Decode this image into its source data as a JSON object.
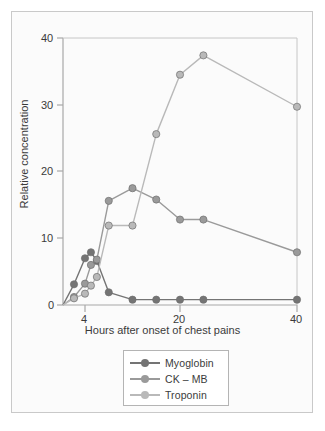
{
  "chart_data": {
    "type": "line",
    "title": "",
    "xlabel": "Hours after onset of chest pains",
    "ylabel": "Relative concentration",
    "xticks": [
      4,
      20,
      40
    ],
    "xtick_labels": [
      "4",
      "20",
      "40"
    ],
    "yticks": [
      0,
      10,
      20,
      30,
      40
    ],
    "ytick_labels": [
      "0",
      "10",
      "20",
      "30",
      "40"
    ],
    "ylim": [
      0,
      40
    ],
    "xlim": [
      2,
      40
    ],
    "grid": false,
    "legend_position": "bottom-center",
    "series": [
      {
        "name": "Myoglobin",
        "color": "#747474",
        "x": [
          2,
          3,
          4,
          5,
          6,
          8,
          12,
          16,
          20,
          24,
          40
        ],
        "y": [
          0,
          3.1,
          7.0,
          7.9,
          6.6,
          1.9,
          0.8,
          0.8,
          0.8,
          0.8,
          0.8
        ]
      },
      {
        "name": "CK – MB",
        "color": "#9a9a9a",
        "x": [
          2,
          3,
          4,
          5,
          6,
          8,
          12,
          16,
          20,
          24,
          40
        ],
        "y": [
          0,
          1.2,
          3.2,
          6.0,
          6.8,
          15.6,
          17.5,
          15.8,
          12.8,
          12.8,
          7.9
        ]
      },
      {
        "name": "Troponin",
        "color": "#b9b9b9",
        "x": [
          2,
          3,
          4,
          5,
          6,
          8,
          12,
          16,
          20,
          24,
          40
        ],
        "y": [
          0,
          1.0,
          1.7,
          2.9,
          4.2,
          11.9,
          11.9,
          25.6,
          34.5,
          37.4,
          29.7
        ]
      }
    ]
  },
  "legend": {
    "items": [
      {
        "label": "Myoglobin",
        "color": "#747474"
      },
      {
        "label": "CK – MB",
        "color": "#9a9a9a"
      },
      {
        "label": "Troponin",
        "color": "#b9b9b9"
      }
    ]
  },
  "axes": {
    "y_label": "Relative concentration",
    "x_label": "Hours after onset of chest pains",
    "y_tick_0": "0",
    "y_tick_10": "10",
    "y_tick_20": "20",
    "y_tick_30": "30",
    "y_tick_40": "40",
    "x_tick_4": "4",
    "x_tick_20": "20",
    "x_tick_40": "40"
  }
}
